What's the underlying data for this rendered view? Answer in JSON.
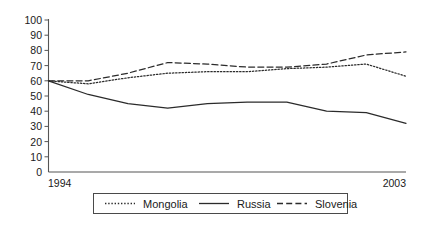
{
  "chart_data": {
    "type": "line",
    "title": "",
    "subtitle": "",
    "xlabel": "",
    "ylabel": "",
    "grid": false,
    "legend_position": "bottom",
    "x": [
      1994,
      1995,
      1996,
      1997,
      1998,
      1999,
      2000,
      2001,
      2002,
      2003
    ],
    "xtick_labels": [
      "1994",
      "2003"
    ],
    "xlim": [
      1994,
      2003
    ],
    "ylim": [
      0,
      100
    ],
    "ytick_labels": [
      "0",
      "10",
      "20",
      "30",
      "40",
      "50",
      "60",
      "70",
      "80",
      "90",
      "100"
    ],
    "ytick_values": [
      0,
      10,
      20,
      30,
      40,
      50,
      60,
      70,
      80,
      90,
      100
    ],
    "series": [
      {
        "name": "Mongolia",
        "style": "dotted",
        "values": [
          60,
          58,
          62,
          65,
          66,
          66,
          68,
          69,
          71,
          63
        ]
      },
      {
        "name": "Russia",
        "style": "solid",
        "values": [
          60,
          51,
          45,
          42,
          45,
          46,
          46,
          40,
          39,
          32
        ]
      },
      {
        "name": "Slovenia",
        "style": "dashed",
        "values": [
          60,
          60,
          65,
          72,
          71,
          69,
          69,
          71,
          77,
          79
        ]
      }
    ]
  },
  "legend": {
    "items": [
      {
        "label": "Mongolia",
        "style": "dotted"
      },
      {
        "label": "Russia",
        "style": "solid"
      },
      {
        "label": "Slovenia",
        "style": "dashed"
      }
    ]
  },
  "axes": {
    "y_ticks": [
      "100",
      "90",
      "80",
      "70",
      "60",
      "50",
      "40",
      "30",
      "20",
      "10",
      "0"
    ],
    "x_start_label": "1994",
    "x_end_label": "2003"
  },
  "colors": {
    "line": "#2b2b2b",
    "axis": "#555555",
    "text": "#1a1a1a",
    "background": "#ffffff"
  }
}
